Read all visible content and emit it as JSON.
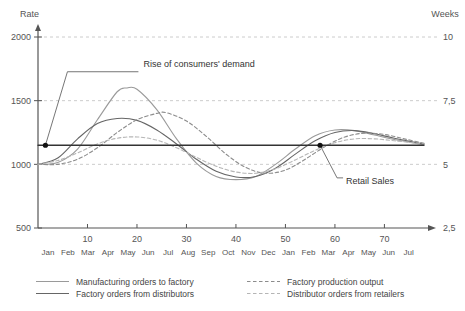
{
  "chart_data": {
    "type": "line",
    "title": "",
    "ylabel": "Rate",
    "y2label": "Weeks",
    "xlabel": "",
    "grid": true,
    "legend_position": "bottom",
    "ylim": [
      500,
      2000
    ],
    "y_ticks": [
      "500",
      "1000",
      "1500",
      "2000"
    ],
    "y_tick_values": [
      500,
      1000,
      1500,
      2000
    ],
    "y2_ticks": [
      "2,5",
      "5",
      "7,5",
      "10"
    ],
    "y2_tick_values": [
      2.5,
      5,
      7.5,
      10
    ],
    "xlim": [
      0,
      78
    ],
    "x_ticks": [
      "10",
      "20",
      "30",
      "40",
      "50",
      "60",
      "70"
    ],
    "x_tick_values": [
      10,
      20,
      30,
      40,
      50,
      60,
      70
    ],
    "month_labels": [
      "Jan",
      "Feb",
      "Mar",
      "Apr",
      "May",
      "Jun",
      "Jul",
      "Aug",
      "Sep",
      "Oct",
      "Nov",
      "Dec",
      "Jan",
      "Feb",
      "Mar",
      "Apr",
      "May",
      "Jun",
      "Jul"
    ],
    "series": [
      {
        "name": "Manufacturing orders to factory",
        "style": "solid",
        "color": "#9a9a9a",
        "x": [
          0,
          4,
          8,
          12,
          16,
          18,
          20,
          24,
          28,
          32,
          36,
          40,
          44,
          48,
          52,
          56,
          60,
          64,
          68,
          72,
          78
        ],
        "values": [
          1000,
          1015,
          1120,
          1350,
          1570,
          1600,
          1590,
          1430,
          1200,
          1010,
          905,
          880,
          905,
          1000,
          1120,
          1225,
          1270,
          1265,
          1230,
          1195,
          1155
        ]
      },
      {
        "name": "Factory orders from distributors",
        "style": "solid",
        "color": "#666666",
        "x": [
          0,
          4,
          8,
          12,
          16,
          20,
          24,
          28,
          32,
          36,
          40,
          44,
          48,
          52,
          56,
          60,
          64,
          68,
          72,
          78
        ],
        "values": [
          1000,
          1050,
          1200,
          1320,
          1360,
          1345,
          1270,
          1160,
          1040,
          945,
          900,
          905,
          970,
          1080,
          1185,
          1250,
          1265,
          1240,
          1205,
          1160
        ]
      },
      {
        "name": "Factory production output",
        "style": "dashed",
        "color": "#8c8c8c",
        "x": [
          0,
          4,
          8,
          12,
          16,
          20,
          24,
          26,
          30,
          34,
          38,
          42,
          46,
          50,
          54,
          58,
          62,
          66,
          70,
          74,
          78
        ],
        "values": [
          1000,
          1000,
          1040,
          1130,
          1250,
          1350,
          1400,
          1405,
          1340,
          1220,
          1080,
          975,
          930,
          955,
          1040,
          1140,
          1215,
          1245,
          1235,
          1200,
          1165
        ]
      },
      {
        "name": "Distributor orders from retailers",
        "style": "dashed",
        "color": "#b5b5b5",
        "x": [
          0,
          4,
          8,
          12,
          16,
          20,
          24,
          28,
          32,
          36,
          40,
          44,
          48,
          52,
          56,
          60,
          64,
          68,
          72,
          78
        ],
        "values": [
          1000,
          1030,
          1090,
          1160,
          1205,
          1215,
          1190,
          1130,
          1055,
          985,
          940,
          930,
          965,
          1035,
          1110,
          1170,
          1200,
          1200,
          1185,
          1160
        ]
      },
      {
        "name": "Retail Sales",
        "style": "solid-flat",
        "color": "#333333",
        "x": [
          0,
          78
        ],
        "values": [
          1150,
          1150
        ]
      }
    ],
    "annotations": [
      {
        "label": "Rise of consumers' demand",
        "point_x": 1.5,
        "point_y": 1150,
        "text_x": 31,
        "text_y": 1790
      },
      {
        "label": "Retail Sales",
        "point_x": 57,
        "point_y": 1150,
        "text_x": 64,
        "text_y": 870
      }
    ],
    "legend": [
      {
        "label": "Manufacturing orders to factory",
        "style": "solid",
        "color": "#9a9a9a"
      },
      {
        "label": "Factory orders from distributors",
        "style": "solid",
        "color": "#666666"
      },
      {
        "label": "Factory production output",
        "style": "dashed",
        "color": "#8c8c8c"
      },
      {
        "label": "Distributor orders from retailers",
        "style": "dashed",
        "color": "#b5b5b5"
      }
    ]
  }
}
